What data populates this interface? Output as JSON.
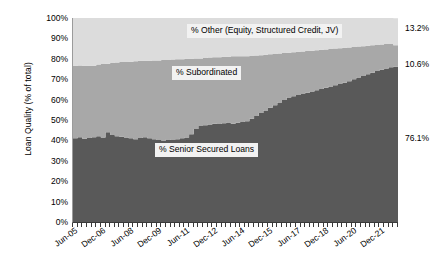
{
  "chart_data": {
    "type": "area",
    "subtype": "stacked-area-100-percent",
    "title": "",
    "xlabel": "",
    "ylabel": "Loan Quality (% of total)",
    "ylim": [
      0,
      100
    ],
    "y_tick_labels": [
      "100%",
      "90%",
      "80%",
      "70%",
      "60%",
      "50%",
      "40%",
      "30%",
      "20%",
      "10%",
      "0%"
    ],
    "y_tick_values": [
      100,
      90,
      80,
      70,
      60,
      50,
      40,
      30,
      20,
      10,
      0
    ],
    "x_tick_labels": [
      "Jun-05",
      "Dec-06",
      "Jun-08",
      "Dec-09",
      "Jun-11",
      "Dec-12",
      "Jun-14",
      "Dec-15",
      "Jun-17",
      "Dec-18",
      "Jun-20",
      "Dec-21"
    ],
    "x_tick_indices": [
      0,
      6,
      12,
      18,
      24,
      30,
      36,
      42,
      48,
      54,
      60,
      66
    ],
    "x_axis_frequency": "quarterly",
    "grid": false,
    "legend_position": "inline-annotations",
    "series": [
      {
        "name": "% Senior Secured Loans",
        "color": "#595959",
        "values": [
          41.0,
          41.5,
          40.8,
          41.2,
          41.6,
          42.0,
          41.4,
          44.0,
          42.6,
          42.0,
          41.8,
          41.4,
          41.0,
          40.6,
          41.2,
          41.6,
          41.0,
          40.6,
          40.2,
          40.0,
          40.4,
          40.2,
          40.6,
          41.0,
          41.4,
          43.0,
          45.6,
          47.0,
          47.4,
          47.8,
          48.2,
          48.0,
          48.4,
          48.8,
          48.2,
          48.6,
          49.0,
          49.4,
          50.6,
          52.0,
          53.4,
          54.6,
          56.0,
          57.2,
          58.6,
          59.8,
          61.0,
          61.6,
          62.2,
          62.8,
          63.4,
          64.0,
          64.6,
          65.2,
          65.8,
          66.4,
          67.0,
          67.6,
          68.2,
          69.0,
          70.0,
          70.8,
          71.6,
          72.4,
          73.2,
          74.0,
          74.6,
          75.2,
          75.8,
          76.1
        ]
      },
      {
        "name": "% Subordinated",
        "color": "#a8a8a8",
        "values": [
          35.6,
          35.2,
          35.8,
          35.4,
          35.0,
          35.2,
          36.0,
          33.6,
          35.4,
          36.2,
          36.6,
          37.0,
          37.6,
          38.2,
          37.8,
          37.4,
          38.0,
          38.6,
          39.0,
          39.4,
          39.0,
          39.4,
          39.2,
          38.8,
          38.6,
          37.0,
          34.6,
          33.2,
          33.0,
          32.8,
          32.6,
          32.8,
          32.6,
          32.2,
          33.0,
          32.6,
          32.2,
          31.8,
          30.8,
          29.6,
          28.4,
          27.4,
          26.2,
          25.2,
          24.0,
          23.0,
          22.0,
          21.6,
          21.2,
          20.8,
          20.4,
          20.0,
          19.6,
          19.2,
          18.8,
          18.4,
          18.0,
          17.6,
          17.2,
          16.6,
          15.8,
          15.2,
          14.6,
          14.0,
          13.4,
          12.8,
          12.4,
          12.0,
          11.4,
          10.6
        ]
      },
      {
        "name": "% Other (Equity, Structured Credit, JV)",
        "color": "#dcdcdc",
        "values": [
          23.4,
          23.3,
          23.4,
          23.4,
          23.4,
          22.8,
          22.6,
          22.4,
          22.0,
          21.8,
          21.6,
          21.6,
          21.4,
          21.2,
          21.0,
          21.0,
          21.0,
          20.8,
          20.8,
          20.6,
          20.6,
          20.4,
          20.2,
          20.2,
          20.0,
          20.0,
          19.8,
          19.8,
          19.6,
          19.4,
          19.2,
          19.2,
          19.0,
          19.0,
          18.8,
          18.8,
          18.8,
          18.8,
          18.6,
          18.4,
          18.2,
          18.0,
          17.8,
          17.6,
          17.4,
          17.2,
          17.0,
          16.8,
          16.6,
          16.4,
          16.2,
          16.0,
          15.8,
          15.6,
          15.4,
          15.2,
          15.0,
          14.8,
          14.6,
          14.4,
          14.2,
          14.0,
          13.8,
          13.6,
          13.4,
          13.2,
          13.0,
          12.8,
          12.8,
          13.2
        ]
      }
    ],
    "annotations": [
      {
        "id": "other",
        "text": "% Other (Equity, Structured Credit, JV)"
      },
      {
        "id": "sub",
        "text": "% Subordinated"
      },
      {
        "id": "senior",
        "text": "% Senior Secured Loans"
      }
    ],
    "endpoint_values": [
      {
        "id": "other",
        "text": "13.2%"
      },
      {
        "id": "sub",
        "text": "10.6%"
      },
      {
        "id": "senior",
        "text": "76.1%"
      }
    ]
  },
  "colors": {
    "senior": "#595959",
    "subordinated": "#a8a8a8",
    "other": "#dcdcdc",
    "axis": "#3a3a3a",
    "label_box": "#f2f2f2",
    "text": "#000000"
  }
}
